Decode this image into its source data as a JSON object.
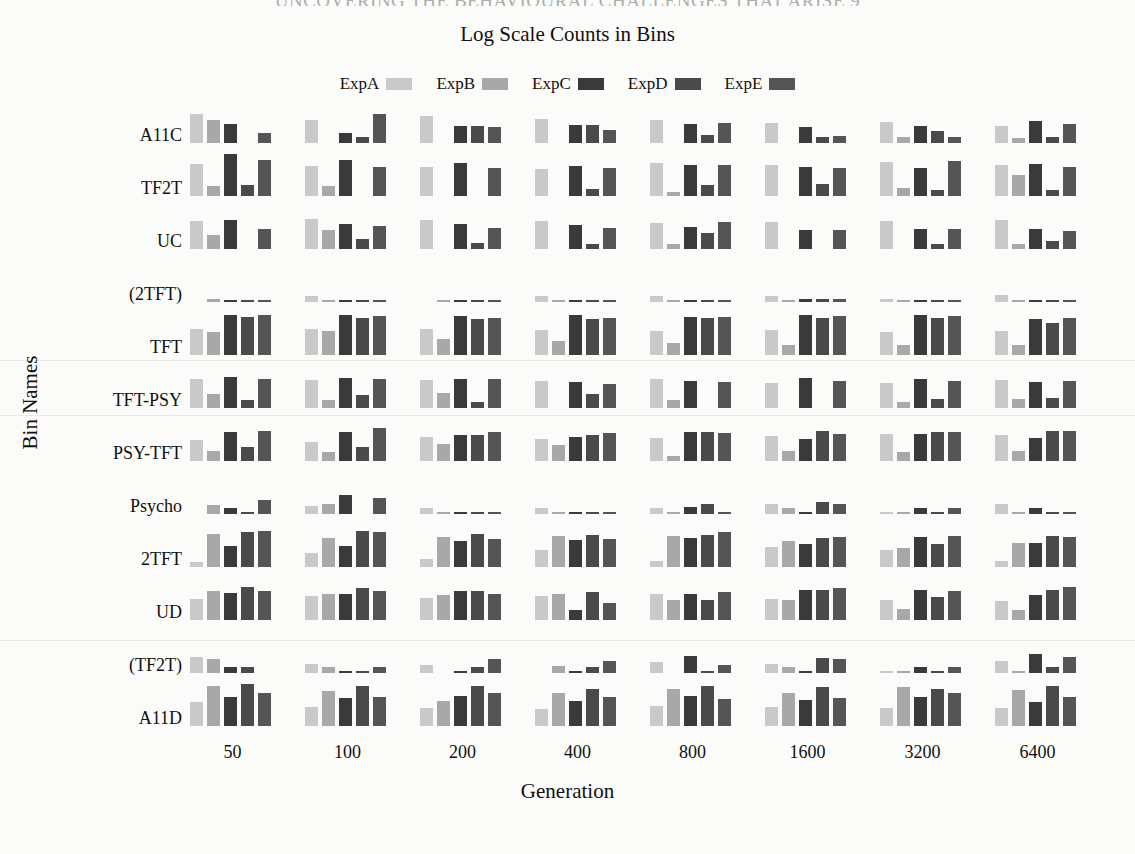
{
  "page": {
    "header_strip": "UNCOVERING THE BEHAVIOURAL CHALLENGES THAT ARISE   9",
    "background": "#fbfbf9"
  },
  "chart_data": {
    "type": "bar",
    "title": "Log Scale Counts in Bins",
    "xlabel": "Generation",
    "ylabel": "Bin Names",
    "grid": false,
    "legend_position": "top-center",
    "orientation": "grouped-rows",
    "scale": "log",
    "categories": [
      "50",
      "100",
      "200",
      "400",
      "800",
      "1600",
      "3200",
      "6400"
    ],
    "bins": [
      "A11C",
      "TF2T",
      "UC",
      "(2TFT)",
      "TFT",
      "TFT-PSY",
      "PSY-TFT",
      "Psycho",
      "2TFT",
      "UD",
      "(TF2T)",
      "A11D"
    ],
    "series_names": [
      "ExpA",
      "ExpB",
      "ExpC",
      "ExpD",
      "ExpE"
    ],
    "series_colors": [
      "#c9c9c9",
      "#a8a8a8",
      "#3a3a3a",
      "#4a4a4a",
      "#555555"
    ],
    "ylim": [
      0,
      1
    ],
    "values": {
      "A11C": [
        [
          0.62,
          0.5,
          0.42,
          0.0,
          0.22
        ],
        [
          0.5,
          0.0,
          0.22,
          0.14,
          0.62
        ],
        [
          0.58,
          0.0,
          0.38,
          0.36,
          0.34
        ],
        [
          0.52,
          0.0,
          0.4,
          0.4,
          0.28
        ],
        [
          0.5,
          0.0,
          0.42,
          0.18,
          0.44
        ],
        [
          0.44,
          0.0,
          0.34,
          0.14,
          0.16
        ],
        [
          0.46,
          0.14,
          0.38,
          0.26,
          0.12
        ],
        [
          0.38,
          0.1,
          0.48,
          0.14,
          0.42
        ]
      ],
      "TF2T": [
        [
          0.7,
          0.22,
          0.92,
          0.24,
          0.78
        ],
        [
          0.66,
          0.22,
          0.78,
          0.0,
          0.62
        ],
        [
          0.62,
          0.0,
          0.72,
          0.0,
          0.6
        ],
        [
          0.58,
          0.0,
          0.66,
          0.16,
          0.6
        ],
        [
          0.72,
          0.08,
          0.68,
          0.24,
          0.68
        ],
        [
          0.68,
          0.0,
          0.64,
          0.26,
          0.6
        ],
        [
          0.74,
          0.18,
          0.6,
          0.14,
          0.76
        ],
        [
          0.68,
          0.46,
          0.7,
          0.12,
          0.62
        ]
      ],
      "UC": [
        [
          0.6,
          0.3,
          0.64,
          0.0,
          0.44
        ],
        [
          0.66,
          0.42,
          0.54,
          0.22,
          0.5
        ],
        [
          0.62,
          0.0,
          0.54,
          0.14,
          0.46
        ],
        [
          0.6,
          0.0,
          0.52,
          0.1,
          0.46
        ],
        [
          0.56,
          0.1,
          0.48,
          0.34,
          0.58
        ],
        [
          0.58,
          0.0,
          0.42,
          0.0,
          0.42
        ],
        [
          0.6,
          0.0,
          0.44,
          0.1,
          0.44
        ],
        [
          0.62,
          0.1,
          0.44,
          0.18,
          0.4
        ]
      ],
      "(2TFT)": [
        [
          0.0,
          0.07,
          0.05,
          0.04,
          0.05
        ],
        [
          0.14,
          0.04,
          0.04,
          0.04,
          0.04
        ],
        [
          0.0,
          0.05,
          0.05,
          0.05,
          0.05
        ],
        [
          0.13,
          0.04,
          0.04,
          0.04,
          0.04
        ],
        [
          0.13,
          0.05,
          0.05,
          0.05,
          0.05
        ],
        [
          0.12,
          0.05,
          0.06,
          0.06,
          0.06
        ],
        [
          0.06,
          0.05,
          0.05,
          0.05,
          0.05
        ],
        [
          0.15,
          0.05,
          0.05,
          0.05,
          0.05
        ]
      ],
      "TFT": [
        [
          0.56,
          0.5,
          0.86,
          0.82,
          0.86
        ],
        [
          0.56,
          0.52,
          0.86,
          0.8,
          0.84
        ],
        [
          0.56,
          0.34,
          0.84,
          0.78,
          0.8
        ],
        [
          0.54,
          0.3,
          0.86,
          0.78,
          0.8
        ],
        [
          0.52,
          0.26,
          0.82,
          0.8,
          0.82
        ],
        [
          0.54,
          0.22,
          0.86,
          0.8,
          0.84
        ],
        [
          0.5,
          0.22,
          0.86,
          0.8,
          0.84
        ],
        [
          0.52,
          0.22,
          0.78,
          0.7,
          0.8
        ]
      ],
      "TFT-PSY": [
        [
          0.64,
          0.3,
          0.68,
          0.18,
          0.64
        ],
        [
          0.6,
          0.18,
          0.66,
          0.28,
          0.62
        ],
        [
          0.6,
          0.32,
          0.62,
          0.14,
          0.62
        ],
        [
          0.58,
          0.0,
          0.56,
          0.3,
          0.52
        ],
        [
          0.62,
          0.18,
          0.58,
          0.0,
          0.56
        ],
        [
          0.54,
          0.0,
          0.66,
          0.0,
          0.58
        ],
        [
          0.54,
          0.14,
          0.62,
          0.2,
          0.58
        ],
        [
          0.6,
          0.2,
          0.56,
          0.22,
          0.58
        ]
      ],
      "PSY-TFT": [
        [
          0.46,
          0.22,
          0.62,
          0.3,
          0.66
        ],
        [
          0.42,
          0.2,
          0.64,
          0.3,
          0.72
        ],
        [
          0.52,
          0.36,
          0.56,
          0.56,
          0.62
        ],
        [
          0.48,
          0.34,
          0.52,
          0.56,
          0.6
        ],
        [
          0.5,
          0.1,
          0.62,
          0.62,
          0.6
        ],
        [
          0.54,
          0.22,
          0.48,
          0.66,
          0.58
        ],
        [
          0.58,
          0.2,
          0.58,
          0.62,
          0.62
        ],
        [
          0.56,
          0.22,
          0.5,
          0.66,
          0.66
        ]
      ],
      "Psycho": [
        [
          0.0,
          0.2,
          0.12,
          0.05,
          0.3
        ],
        [
          0.18,
          0.22,
          0.42,
          0.0,
          0.34
        ],
        [
          0.12,
          0.05,
          0.05,
          0.05,
          0.05
        ],
        [
          0.14,
          0.05,
          0.05,
          0.05,
          0.05
        ],
        [
          0.14,
          0.04,
          0.16,
          0.22,
          0.04
        ],
        [
          0.22,
          0.14,
          0.04,
          0.26,
          0.22
        ],
        [
          0.04,
          0.04,
          0.14,
          0.04,
          0.14
        ],
        [
          0.22,
          0.04,
          0.12,
          0.04,
          0.04
        ]
      ],
      "2TFT": [
        [
          0.1,
          0.72,
          0.46,
          0.76,
          0.78
        ],
        [
          0.3,
          0.62,
          0.46,
          0.78,
          0.76
        ],
        [
          0.18,
          0.66,
          0.56,
          0.72,
          0.6
        ],
        [
          0.36,
          0.68,
          0.58,
          0.7,
          0.6
        ],
        [
          0.14,
          0.68,
          0.64,
          0.7,
          0.76
        ],
        [
          0.44,
          0.56,
          0.5,
          0.62,
          0.66
        ],
        [
          0.36,
          0.42,
          0.66,
          0.5,
          0.68
        ],
        [
          0.12,
          0.52,
          0.52,
          0.68,
          0.66
        ]
      ],
      "UD": [
        [
          0.46,
          0.62,
          0.58,
          0.72,
          0.62
        ],
        [
          0.52,
          0.56,
          0.56,
          0.7,
          0.62
        ],
        [
          0.48,
          0.54,
          0.64,
          0.64,
          0.56
        ],
        [
          0.52,
          0.56,
          0.22,
          0.6,
          0.36
        ],
        [
          0.56,
          0.44,
          0.56,
          0.44,
          0.6
        ],
        [
          0.46,
          0.44,
          0.66,
          0.66,
          0.7
        ],
        [
          0.44,
          0.24,
          0.66,
          0.5,
          0.64
        ],
        [
          0.42,
          0.22,
          0.54,
          0.66,
          0.72
        ]
      ],
      "(TF2T)": [
        [
          0.34,
          0.3,
          0.12,
          0.12,
          0.0
        ],
        [
          0.2,
          0.12,
          0.04,
          0.04,
          0.14
        ],
        [
          0.18,
          0.0,
          0.04,
          0.14,
          0.3
        ],
        [
          0.0,
          0.16,
          0.04,
          0.14,
          0.26
        ],
        [
          0.24,
          0.0,
          0.36,
          0.04,
          0.18
        ],
        [
          0.2,
          0.14,
          0.04,
          0.32,
          0.3
        ],
        [
          0.04,
          0.04,
          0.14,
          0.04,
          0.14
        ],
        [
          0.26,
          0.04,
          0.42,
          0.12,
          0.34
        ]
      ],
      "A11D": [
        [
          0.52,
          0.88,
          0.62,
          0.92,
          0.72
        ],
        [
          0.42,
          0.76,
          0.6,
          0.88,
          0.64
        ],
        [
          0.4,
          0.54,
          0.66,
          0.86,
          0.72
        ],
        [
          0.38,
          0.72,
          0.54,
          0.8,
          0.62
        ],
        [
          0.44,
          0.8,
          0.66,
          0.86,
          0.58
        ],
        [
          0.42,
          0.72,
          0.56,
          0.84,
          0.6
        ],
        [
          0.4,
          0.84,
          0.62,
          0.8,
          0.72
        ],
        [
          0.4,
          0.78,
          0.52,
          0.88,
          0.62
        ]
      ]
    }
  }
}
